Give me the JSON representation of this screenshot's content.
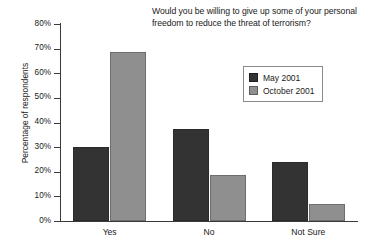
{
  "chart_data": {
    "type": "bar",
    "title": "Would you be willing to give up some of your personal freedom to reduce the threat of terrorism?",
    "xlabel": "",
    "ylabel": "Percentage of respondents",
    "categories": [
      "Yes",
      "No",
      "Not Sure"
    ],
    "series": [
      {
        "name": "May 2001",
        "color": "#333333",
        "values": [
          30,
          37.5,
          24
        ]
      },
      {
        "name": "October 2001",
        "color": "#8f8f8f",
        "values": [
          68.5,
          18.5,
          7
        ]
      }
    ],
    "ylim": [
      0,
      80
    ],
    "ytick_values": [
      80,
      70,
      60,
      50,
      40,
      30,
      20,
      10,
      0
    ],
    "ytick_labels": [
      "80%",
      "70%",
      "60%",
      "50%",
      "40%",
      "30%",
      "20%",
      "10%",
      "0%"
    ],
    "grid": false,
    "legend_position": "upper-right-inside"
  },
  "legend": {
    "items": [
      {
        "label": "May 2001"
      },
      {
        "label": "October 2001"
      }
    ]
  }
}
